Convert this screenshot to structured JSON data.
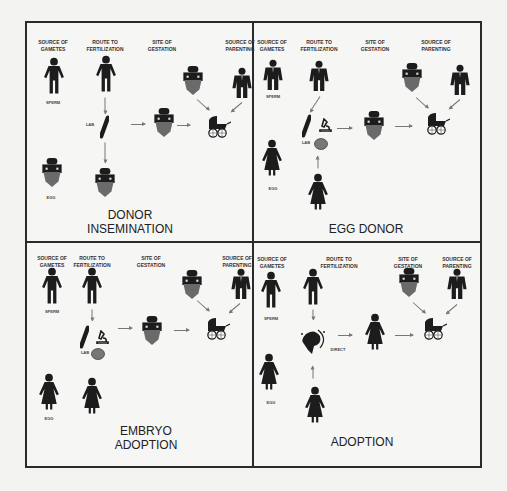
{
  "column_headers": {
    "gametes": "SOURCE OF\nGAMETES",
    "route": "ROUTE TO\nFERTILIZATION",
    "gestation": "SITE OF\nGESTATION",
    "parenting": "SOURCE OF\nPARENTING"
  },
  "labels": {
    "sperm": "SPERM",
    "egg": "EGG",
    "lab": "LAB",
    "direct": "DIRECT"
  },
  "quadrants": [
    {
      "id": "donor-insemination",
      "title_line1": "DONOR",
      "title_line2": "INSEMINATION"
    },
    {
      "id": "egg-donor",
      "title_line1": "EGG DONOR",
      "title_line2": ""
    },
    {
      "id": "embryo-adoption",
      "title_line1": "EMBRYO",
      "title_line2": "ADOPTION"
    },
    {
      "id": "adoption",
      "title_line1": "ADOPTION",
      "title_line2": ""
    }
  ],
  "colors": {
    "border": "#2a2a2a",
    "figure": "#1c1c1c",
    "gown": "#6a6a6a",
    "arrow": "#777777"
  }
}
